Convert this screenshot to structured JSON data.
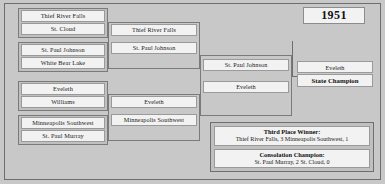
{
  "year": "1951",
  "rounds": {
    "quarterfinals": {
      "label": "Quarterfinals",
      "matchups": [
        {
          "top": "Thief River Falls",
          "bottom": "St. Cloud"
        },
        {
          "top": "St. Paul Johnson",
          "bottom": "White Bear Lake"
        },
        {
          "top": "Eveleth",
          "bottom": "Williams"
        },
        {
          "top": "Minneapolis Southwest",
          "bottom": "St. Paul Murray"
        }
      ]
    },
    "semifinals": {
      "label": "Semifinals",
      "winners": [
        "Thief River Falls",
        "St. Paul Johnson",
        "Eveleth",
        "Minneapolis Southwest"
      ]
    },
    "final": {
      "label": "Final",
      "matchup": {
        "top": "St. Paul Johnson",
        "bottom": "Eveleth"
      }
    },
    "champion": {
      "team": "Eveleth",
      "label": "State Champion"
    }
  },
  "results": {
    "third_place": {
      "title": "Third Place Winner:",
      "score": "Thief River Falls, 3   Minneapolis Southwest, 1"
    },
    "consolation": {
      "title": "Consolation Champion:",
      "score": "St. Paul Murray, 2   St. Cloud, 0"
    }
  }
}
